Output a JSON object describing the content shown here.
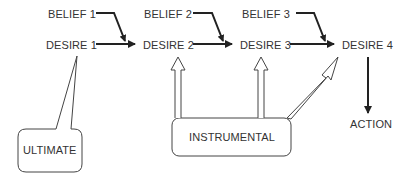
{
  "diagram": {
    "beliefs": [
      {
        "label": "BELIEF 1"
      },
      {
        "label": "BELIEF 2"
      },
      {
        "label": "BELIEF 3"
      }
    ],
    "desires": [
      {
        "label": "DESIRE 1"
      },
      {
        "label": "DESIRE 2"
      },
      {
        "label": "DESIRE 3"
      },
      {
        "label": "DESIRE 4"
      }
    ],
    "action": {
      "label": "ACTION"
    },
    "ultimate": {
      "label": "ULTIMATE"
    },
    "instrumental": {
      "label": "INSTRUMENTAL"
    },
    "colors": {
      "stroke": "#222222",
      "text": "#333333",
      "background": "#ffffff"
    }
  }
}
